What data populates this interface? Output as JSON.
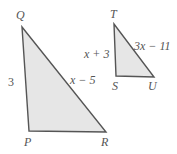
{
  "diagram": {
    "triangles": [
      {
        "name": "PQR",
        "vertices": {
          "Q": [
            22,
            27
          ],
          "P": [
            29,
            131
          ],
          "R": [
            106,
            132
          ]
        },
        "side_labels": {
          "QP": "3",
          "QR": "x − 5"
        }
      },
      {
        "name": "STU",
        "vertices": {
          "T": [
            114,
            24
          ],
          "S": [
            116,
            76
          ],
          "U": [
            154,
            77
          ]
        },
        "side_labels": {
          "TS": "x + 3",
          "TU": "3x − 11"
        }
      }
    ],
    "labels": {
      "Q": "Q",
      "P": "P",
      "R": "R",
      "T": "T",
      "S": "S",
      "U": "U",
      "side_qp": "3",
      "side_qr": "x − 5",
      "side_ts": "x + 3",
      "side_tu": "3x − 11"
    },
    "colors": {
      "fill": "#e6e6e6",
      "stroke": "#555555",
      "text": "#555555"
    }
  }
}
